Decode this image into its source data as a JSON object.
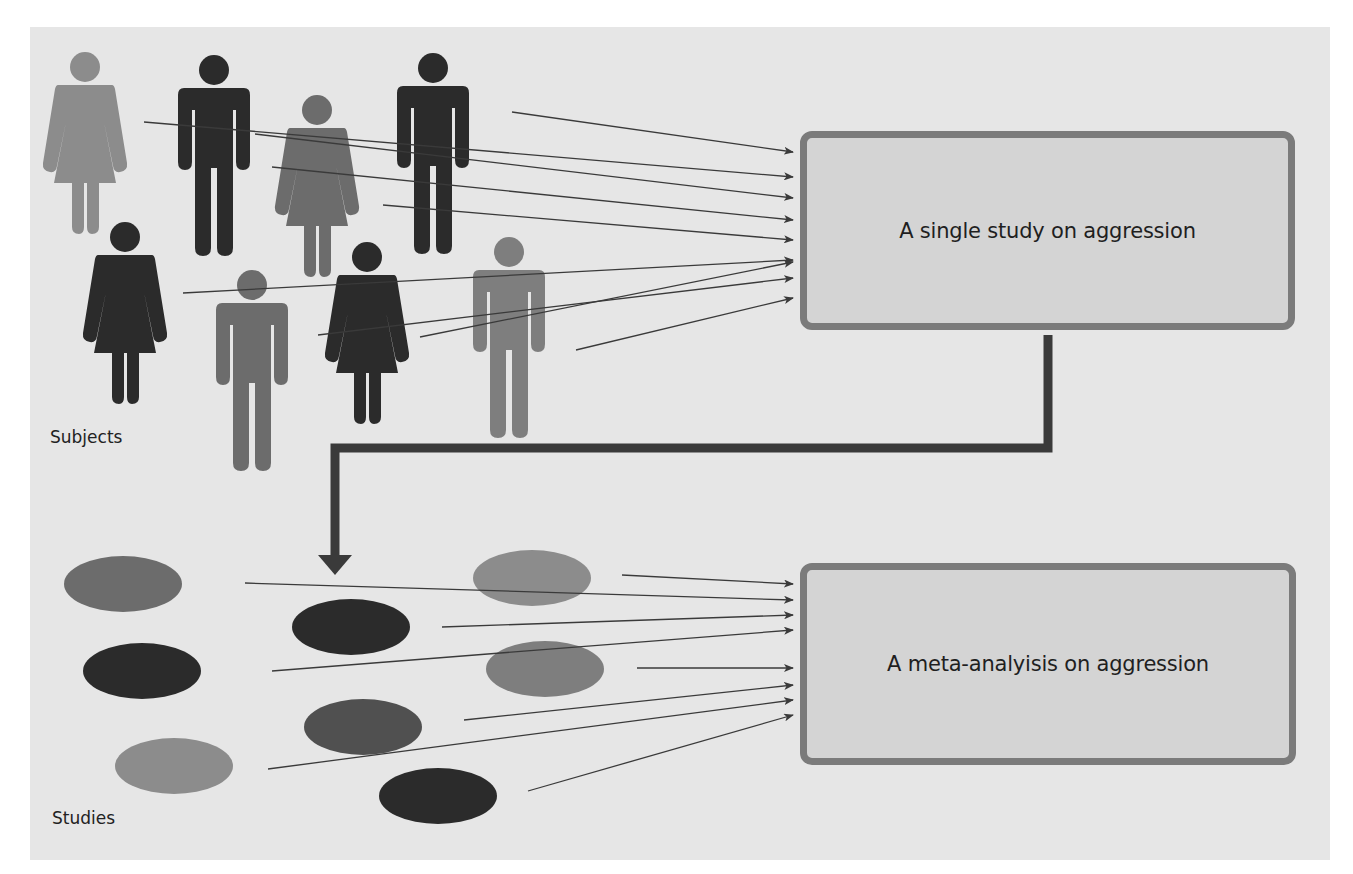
{
  "diagram": {
    "title_boxes": {
      "single_study": {
        "label": "A single study on aggression"
      },
      "meta_analysis": {
        "label": "A meta-analyisis on aggression"
      }
    },
    "captions": {
      "subjects": "Subjects",
      "studies": "Studies"
    },
    "colors": {
      "background": "#e6e6e6",
      "box_fill": "#d4d4d4",
      "box_border": "#7b7b7b",
      "dark": "#2b2b2b",
      "mid": "#6c6c6c",
      "light": "#8c8c8c",
      "connector": "#3a3a3a"
    },
    "subjects": [
      {
        "type": "female",
        "shade": "light"
      },
      {
        "type": "male",
        "shade": "dark"
      },
      {
        "type": "female",
        "shade": "mid"
      },
      {
        "type": "male",
        "shade": "dark"
      },
      {
        "type": "female",
        "shade": "dark"
      },
      {
        "type": "male",
        "shade": "light"
      },
      {
        "type": "female",
        "shade": "dark"
      },
      {
        "type": "male",
        "shade": "light"
      }
    ],
    "studies": [
      {
        "shade": "mid"
      },
      {
        "shade": "light"
      },
      {
        "shade": "dark"
      },
      {
        "shade": "dark"
      },
      {
        "shade": "light"
      },
      {
        "shade": "mid"
      },
      {
        "shade": "light"
      },
      {
        "shade": "dark"
      }
    ],
    "flow": "Subjects feed into a single study; multiple studies feed into a meta-analysis"
  }
}
